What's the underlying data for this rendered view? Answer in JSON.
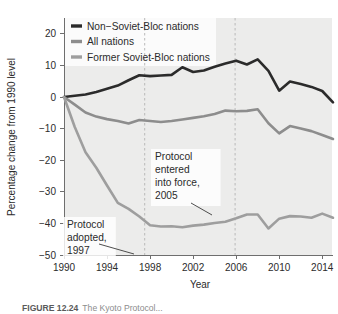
{
  "figure": {
    "caption_prefix": "FIGURE 12.24",
    "caption_rest": "The Kyoto Protocol...",
    "background": "#ffffff"
  },
  "chart_data": {
    "type": "line",
    "title": "",
    "xlabel": "Year",
    "ylabel": "Percentage change from 1990 level",
    "xlim": [
      1990,
      2015
    ],
    "ylim": [
      -50,
      25
    ],
    "xticks": [
      1990,
      1994,
      1998,
      2002,
      2006,
      2010,
      2014
    ],
    "yticks": [
      20,
      10,
      0,
      -10,
      -20,
      -30,
      -40,
      -50
    ],
    "xtick_labels": [
      "1990",
      "1994",
      "1998",
      "2002",
      "2006",
      "2010",
      "2014"
    ],
    "ytick_labels": [
      "20",
      "10",
      "0",
      "-10",
      "-20",
      "-30",
      "-40",
      "-50"
    ],
    "grid": false,
    "legend_position": "top-left",
    "x": [
      1990,
      1991,
      1992,
      1993,
      1994,
      1995,
      1996,
      1997,
      1998,
      1999,
      2000,
      2001,
      2002,
      2003,
      2004,
      2005,
      2006,
      2007,
      2008,
      2009,
      2010,
      2011,
      2012,
      2013,
      2014,
      2015
    ],
    "series": [
      {
        "name": "Non-Soviet-Bloc nations",
        "color": "#2b2b2b",
        "width": 2.6,
        "values": [
          0,
          0.4,
          0.8,
          1.6,
          2.6,
          3.6,
          5.3,
          6.9,
          6.6,
          6.8,
          7.0,
          9.4,
          7.9,
          8.4,
          9.6,
          10.6,
          11.5,
          10.3,
          11.9,
          8.3,
          2.0,
          4.9,
          4.1,
          3.2,
          2.6,
          2.9
        ],
        "values2": [
          0,
          0.4,
          0.8,
          1.6,
          2.6,
          3.6,
          5.3,
          6.9,
          6.6,
          6.8,
          7.0,
          9.4,
          7.9,
          8.4,
          9.6,
          10.6,
          11.5,
          10.3,
          11.9,
          8.3,
          2.0,
          4.9,
          4.1,
          3.2,
          1.9,
          -1.7
        ]
      },
      {
        "name": "All nations",
        "color": "#8d8d8d",
        "width": 2.6,
        "values": [
          0,
          -2.4,
          -4.9,
          -6.2,
          -7.0,
          -7.6,
          -8.4,
          -7.3,
          -7.6,
          -7.9,
          -7.6,
          -7.1,
          -6.6,
          -6.1,
          -5.4,
          -4.3,
          -4.5,
          -4.4,
          -3.9,
          -8.3,
          -11.5,
          -9.2,
          -10.0,
          -10.8,
          -12.0,
          -13.3
        ]
      },
      {
        "name": "Former Soviet-Bloc nations",
        "color": "#9e9e9e",
        "width": 2.6,
        "values": [
          0,
          -9.5,
          -17.5,
          -22.4,
          -28.0,
          -33.5,
          -35.4,
          -37.8,
          -40.6,
          -41.0,
          -40.9,
          -41.2,
          -40.7,
          -40.4,
          -39.9,
          -39.5,
          -38.4,
          -37.2,
          -37.2,
          -41.6,
          -38.5,
          -37.7,
          -37.8,
          -38.2,
          -36.9,
          -38.2
        ]
      }
    ],
    "annotations": [
      {
        "id": "protocol-adopted",
        "lines": [
          "Protocol",
          "adopted,",
          "1997"
        ],
        "text": "Protocol adopted, 1997",
        "points_to_year": 1997
      },
      {
        "id": "protocol-in-force",
        "lines": [
          "Protocol",
          "entered",
          "into force,",
          "2005"
        ],
        "text": "Protocol entered into force, 2005",
        "points_to_year": 2005
      }
    ],
    "event_lines": [
      {
        "label": "1997",
        "year": 1997.5
      },
      {
        "label": "2005",
        "year": 2005.9
      }
    ]
  },
  "legend": {
    "items": [
      {
        "label": "Non−Soviet-Bloc nations",
        "color": "#2b2b2b"
      },
      {
        "label": "All nations",
        "color": "#8d8d8d"
      },
      {
        "label": "Former Soviet-Bloc nations",
        "color": "#9e9e9e"
      }
    ]
  }
}
